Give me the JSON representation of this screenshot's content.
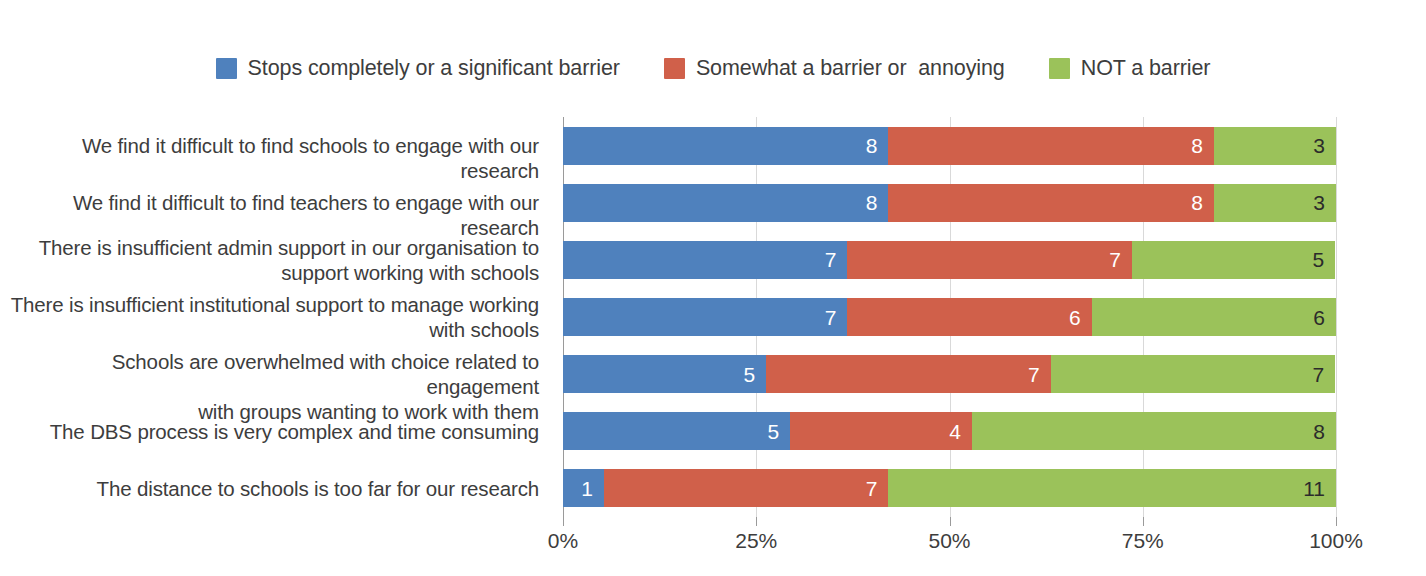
{
  "chart_data": {
    "type": "bar",
    "orientation": "horizontal",
    "stacked": true,
    "normalized_percent": true,
    "title": "",
    "xlabel": "",
    "ylabel": "",
    "xlim": [
      0,
      100
    ],
    "xticks": [
      "0%",
      "25%",
      "50%",
      "75%",
      "100%"
    ],
    "xtick_values": [
      0,
      25,
      50,
      75,
      100
    ],
    "grid": "vertical",
    "legend_position": "top-center",
    "categories": [
      "We find it difficult to find schools to engage with our research",
      "We find it difficult to find teachers to engage with our research",
      "There is insufficient admin support in our organisation to support working with schools",
      "There is insufficient institutional support to manage working with schools",
      "Schools are overwhelmed with choice related to engagement with groups wanting to work with them",
      "The DBS process is very complex and time consuming",
      "The distance to schools is too far for our research"
    ],
    "series": [
      {
        "name": "Stops completely or a significant barrier",
        "color": "#4f81bd",
        "values": [
          8,
          8,
          7,
          7,
          5,
          5,
          1
        ]
      },
      {
        "name": "Somewhat a barrier or  annoying",
        "color": "#d0604a",
        "values": [
          8,
          8,
          7,
          6,
          7,
          4,
          7
        ]
      },
      {
        "name": "NOT a barrier",
        "color": "#9bc košice"
      }
    ]
  },
  "legend": {
    "items": [
      {
        "label": "Stops completely or a significant barrier",
        "color": "#4f81bd"
      },
      {
        "label": "Somewhat a barrier or  annoying",
        "color": "#d0604a"
      },
      {
        "label": "NOT a barrier",
        "color": "#9bc25a"
      }
    ]
  },
  "axis": {
    "ticks": [
      {
        "label": "0%",
        "value": 0
      },
      {
        "label": "25%",
        "value": 25
      },
      {
        "label": "50%",
        "value": 50
      },
      {
        "label": "75%",
        "value": 75
      },
      {
        "label": "100%",
        "value": 100
      }
    ]
  },
  "rows": [
    {
      "category": "We find it difficult to find schools to engage with our research",
      "lines": [
        "We find it difficult to find schools to engage with our research"
      ],
      "segments": [
        {
          "series": "Stops completely or a significant barrier",
          "value": 8,
          "percent": 42.1,
          "color": "#4f81bd"
        },
        {
          "series": "Somewhat a barrier or  annoying",
          "value": 8,
          "percent": 42.1,
          "color": "#d0604a"
        },
        {
          "series": "NOT a barrier",
          "value": 3,
          "percent": 15.8,
          "color": "#9bc25a"
        }
      ],
      "total": 19
    },
    {
      "category": "We find it difficult to find teachers to engage with our research",
      "lines": [
        "We find it difficult to find teachers to engage with our research"
      ],
      "segments": [
        {
          "series": "Stops completely or a significant barrier",
          "value": 8,
          "percent": 42.1,
          "color": "#4f81bd"
        },
        {
          "series": "Somewhat a barrier or  annoying",
          "value": 8,
          "percent": 42.1,
          "color": "#d0604a"
        },
        {
          "series": "NOT a barrier",
          "value": 3,
          "percent": 15.8,
          "color": "#9bc25a"
        }
      ],
      "total": 19
    },
    {
      "category": "There is insufficient admin support in our organisation to support working with schools",
      "lines": [
        "There is insufficient admin support in our organisation to",
        "support working with schools"
      ],
      "segments": [
        {
          "series": "Stops completely or a significant barrier",
          "value": 7,
          "percent": 36.8,
          "color": "#4f81bd"
        },
        {
          "series": "Somewhat a barrier or  annoying",
          "value": 7,
          "percent": 36.8,
          "color": "#d0604a"
        },
        {
          "series": "NOT a barrier",
          "value": 5,
          "percent": 26.3,
          "color": "#9bc25a"
        }
      ],
      "total": 19
    },
    {
      "category": "There is insufficient institutional support to manage working with schools",
      "lines": [
        "There is insufficient institutional support to manage working",
        "with schools"
      ],
      "segments": [
        {
          "series": "Stops completely or a significant barrier",
          "value": 7,
          "percent": 36.8,
          "color": "#4f81bd"
        },
        {
          "series": "Somewhat a barrier or  annoying",
          "value": 6,
          "percent": 31.6,
          "color": "#d0604a"
        },
        {
          "series": "NOT a barrier",
          "value": 6,
          "percent": 31.6,
          "color": "#9bc25a"
        }
      ],
      "total": 19
    },
    {
      "category": "Schools are overwhelmed with choice related to engagement with groups wanting to work with them",
      "lines": [
        "Schools are overwhelmed with choice related to engagement",
        "with groups wanting to work with them"
      ],
      "segments": [
        {
          "series": "Stops completely or a significant barrier",
          "value": 5,
          "percent": 26.3,
          "color": "#4f81bd"
        },
        {
          "series": "Somewhat a barrier or  annoying",
          "value": 7,
          "percent": 36.8,
          "color": "#d0604a"
        },
        {
          "series": "NOT a barrier",
          "value": 7,
          "percent": 36.8,
          "color": "#9bc25a"
        }
      ],
      "total": 19
    },
    {
      "category": "The DBS process is very complex and time consuming",
      "lines": [
        "The DBS process is very complex and time consuming"
      ],
      "segments": [
        {
          "series": "Stops completely or a significant barrier",
          "value": 5,
          "percent": 29.4,
          "color": "#4f81bd"
        },
        {
          "series": "Somewhat a barrier or  annoying",
          "value": 4,
          "percent": 23.5,
          "color": "#d0604a"
        },
        {
          "series": "NOT a barrier",
          "value": 8,
          "percent": 47.1,
          "color": "#9bc25a"
        }
      ],
      "total": 17
    },
    {
      "category": "The distance to schools is too far for our research",
      "lines": [
        "The distance to schools is too far for our research"
      ],
      "segments": [
        {
          "series": "Stops completely or a significant barrier",
          "value": 1,
          "percent": 5.3,
          "color": "#4f81bd"
        },
        {
          "series": "Somewhat a barrier or  annoying",
          "value": 7,
          "percent": 36.8,
          "color": "#d0604a"
        },
        {
          "series": "NOT a barrier",
          "value": 11,
          "percent": 57.9,
          "color": "#9bc25a"
        }
      ],
      "total": 19
    }
  ]
}
